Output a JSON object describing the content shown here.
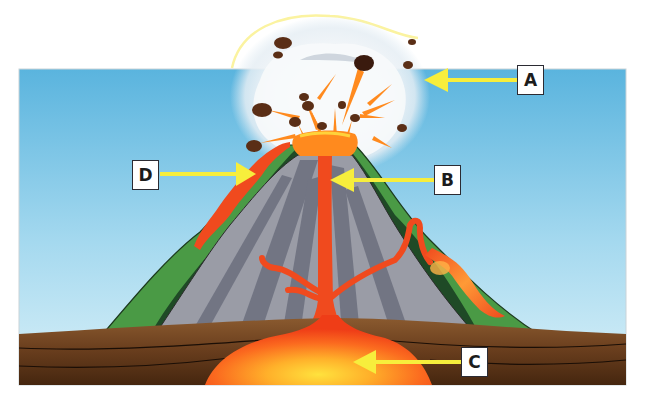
{
  "diagram": {
    "colors": {
      "sky_top": "#5fb8e0",
      "sky_bottom": "#d4eef7",
      "ground_dark": "#4a2a14",
      "ground_mid": "#6b3f1d",
      "ground_light": "#8a5a2e",
      "cone_gray": "#9a9ca6",
      "cone_stripe": "#6e7180",
      "vegetation_green": "#4a9a45",
      "vegetation_dark": "#1f4a26",
      "lava_red": "#f04a1e",
      "lava_orange": "#ff8a1e",
      "magma_yellow": "#ffd23a",
      "arrow_yellow": "#f7ee3c",
      "ash_white": "#f6f8fa",
      "rock_brown": "#5a2e16"
    },
    "labels": [
      {
        "id": "A",
        "text": "A",
        "points_to": "eruption-cloud"
      },
      {
        "id": "B",
        "text": "B",
        "points_to": "central-vent"
      },
      {
        "id": "C",
        "text": "C",
        "points_to": "magma-chamber"
      },
      {
        "id": "D",
        "text": "D",
        "points_to": "lava-flow"
      }
    ]
  }
}
